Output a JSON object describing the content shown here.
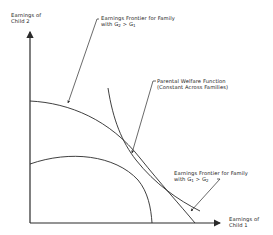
{
  "diagram": {
    "type": "economics-frontier-diagram",
    "axes": {
      "y_label_line1": "Earnings of",
      "y_label_line2": "Child 2",
      "x_label_line1": "Earnings of",
      "x_label_line2": "Child 1"
    },
    "curves": [
      {
        "id": "frontier-g2-gt-g1",
        "label_line1": "Earnings Frontier for Family",
        "label_line2_prefix": "with G",
        "label_line2_sub1": "2",
        "label_line2_mid": " > G",
        "label_line2_sub2": "1"
      },
      {
        "id": "parental-welfare-function",
        "label_line1": "Parental Welfare Function",
        "label_line2": "(Constant Across Families)"
      },
      {
        "id": "frontier-g1-gt-g2",
        "label_line1": "Earnings Frontier for Family",
        "label_line2_prefix": "with G",
        "label_line2_sub1": "1",
        "label_line2_mid": " > G",
        "label_line2_sub2": "2"
      }
    ],
    "colors": {
      "line": "#2a2a2a",
      "background": "#ffffff"
    }
  }
}
